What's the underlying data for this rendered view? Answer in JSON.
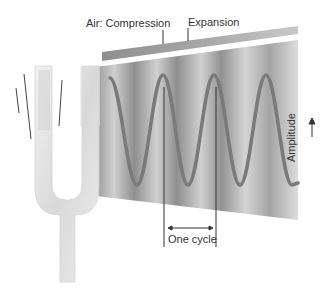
{
  "diagram": {
    "labels": {
      "compression": "Air: Compression",
      "expansion": "Expansion",
      "cycle": "One cycle",
      "amplitude": "Amplitude"
    },
    "wave": {
      "peaks_x": [
        163,
        214,
        266
      ],
      "troughs_x": [
        137,
        188,
        240,
        292
      ],
      "cycles_shown": 3.5
    },
    "colors": {
      "wave": "#7a7a7a",
      "panel_dark": "#8c8c8c",
      "panel_light": "#d6d6d6",
      "fork": "#e6e6e6",
      "lines": "#333333"
    }
  }
}
